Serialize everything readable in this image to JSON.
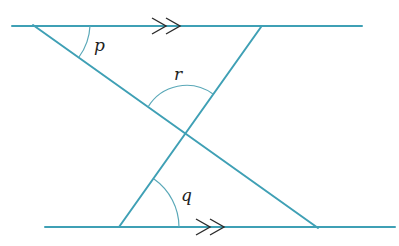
{
  "diagram": {
    "type": "geometry-parallel-lines",
    "colors": {
      "line": "#3fa0b5",
      "arc": "#5aa8b8",
      "arrow": "#2b2b2b",
      "label": "#222222",
      "background": "#ffffff"
    },
    "parallel_lines": [
      {
        "id": "top",
        "x1": 12,
        "y1": 26,
        "x2": 362,
        "y2": 26,
        "arrow_mark": ">>",
        "arrow_x": 166
      },
      {
        "id": "bottom",
        "x1": 45,
        "y1": 227,
        "x2": 395,
        "y2": 227,
        "arrow_mark": ">>",
        "arrow_x": 210
      }
    ],
    "transversals": [
      {
        "id": "line-a",
        "x1": 33,
        "y1": 25,
        "x2": 318,
        "y2": 228
      },
      {
        "id": "line-b",
        "x1": 261,
        "y1": 27,
        "x2": 119,
        "y2": 227
      }
    ],
    "intersection": {
      "x": 186,
      "y": 132
    },
    "angles": [
      {
        "label": "p",
        "location": "between top line and line-a at top-left vertex"
      },
      {
        "label": "r",
        "location": "above intersection, between line-a and line-b"
      },
      {
        "label": "q",
        "location": "between bottom line and line-b at bottom-left vertex"
      }
    ]
  }
}
